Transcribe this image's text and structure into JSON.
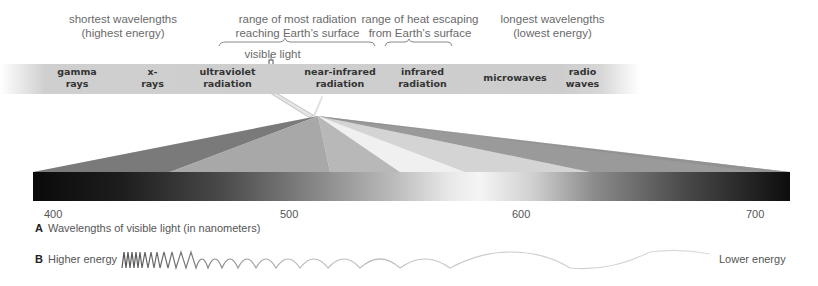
{
  "top_labels": {
    "shortest": "shortest wavelengths\n(highest energy)",
    "most_radiation": "range of most radiation\nreaching Earth’s surface",
    "heat_escaping": "range of heat escaping\nfrom Earth’s surface",
    "longest": "longest wavelengths\n(lowest energy)",
    "visible_light": "visible light"
  },
  "spectrum_bands": [
    {
      "id": "gamma",
      "label": "gamma\nrays"
    },
    {
      "id": "xrays",
      "label": "x-\nrays"
    },
    {
      "id": "uv",
      "label": "ultraviolet\nradiation"
    },
    {
      "id": "nir",
      "label": "near-infrared\nradiation"
    },
    {
      "id": "ir",
      "label": "infrared\nradiation"
    },
    {
      "id": "microwaves",
      "label": "microwaves"
    },
    {
      "id": "radio",
      "label": "radio\nwaves"
    }
  ],
  "visible_axis": {
    "ticks": [
      "400",
      "500",
      "600",
      "700"
    ]
  },
  "captions": {
    "a_letter": "A",
    "a_text": "Wavelengths of visible light (in nanometers)",
    "b_letter": "B",
    "b_left": "Higher energy",
    "b_right": "Lower energy"
  },
  "colors": {
    "band_gray": "#cdcdcd",
    "text": "#555555",
    "bold_text": "#333333"
  }
}
